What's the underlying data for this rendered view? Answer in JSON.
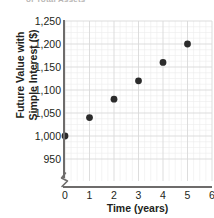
{
  "figure": {
    "cropped_header_text": "of Total Assets"
  },
  "chart_data": {
    "type": "scatter",
    "title": "",
    "xlabel": "Time (years)",
    "ylabel": "Future Value with Simple Interest ($)",
    "ylabel_line1": "Future Value with",
    "ylabel_line2": "Simple Interest ($)",
    "x": [
      0,
      1,
      2,
      3,
      4,
      5
    ],
    "values": [
      1000,
      1040,
      1080,
      1120,
      1160,
      1200
    ],
    "points": [
      {
        "x": 0,
        "y": 1000
      },
      {
        "x": 1,
        "y": 1040
      },
      {
        "x": 2,
        "y": 1080
      },
      {
        "x": 3,
        "y": 1120
      },
      {
        "x": 4,
        "y": 1160
      },
      {
        "x": 5,
        "y": 1200
      }
    ],
    "xlim": [
      0,
      6
    ],
    "ylim": [
      930,
      1250
    ],
    "xticks": [
      0,
      1,
      2,
      3,
      4,
      5,
      6
    ],
    "xtick_labels": [
      "0",
      "1",
      "2",
      "3",
      "4",
      "5",
      "6"
    ],
    "yticks": [
      950,
      1000,
      1050,
      1100,
      1150,
      1200,
      1250
    ],
    "ytick_labels": [
      "950",
      "1,000",
      "1,050",
      "1,100",
      "1,150",
      "1,200",
      "1,250"
    ],
    "grid": true,
    "minor_grid": true,
    "legend": null,
    "y_axis_break": true,
    "marker_color": "#2b2b2b",
    "grid_color": "#d9d9d9",
    "minor_grid_color": "#ececec",
    "axis_color": "#6e6c6b",
    "text_color": "#231f20"
  }
}
